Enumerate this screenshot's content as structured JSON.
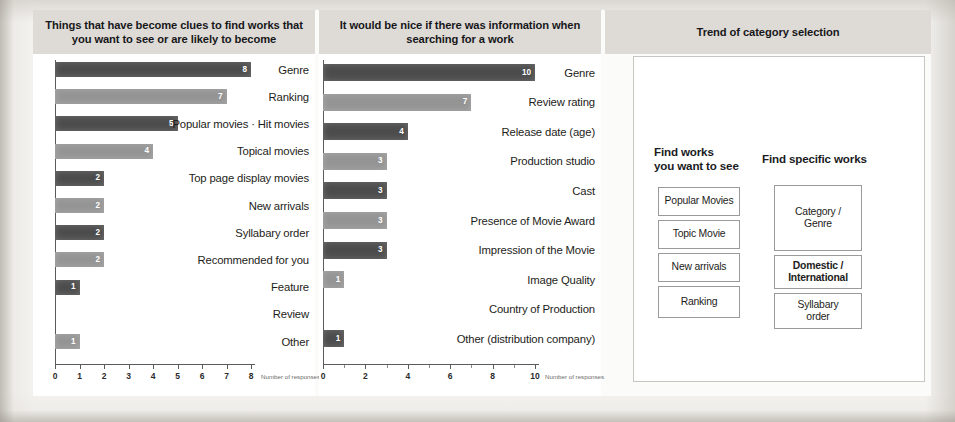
{
  "panels": {
    "left": {
      "title": "Things that have become clues to find works that you want to see or are likely to become",
      "axis_title": "Number of responses"
    },
    "middle": {
      "title": "It would be nice if there was information when searching for a work",
      "axis_title": "Number of responses"
    },
    "right": {
      "title": "Trend of category selection",
      "col1_title": "Find works\nyou want to see",
      "col1_title_line1": "Find works",
      "col1_title_line2": "you want to see",
      "col2_title": "Find specific works"
    }
  },
  "chart_data": [
    {
      "type": "bar",
      "orientation": "horizontal",
      "title": "Things that have become clues to find works that you want to see or are likely to become",
      "xlabel": "Number of responses",
      "ylabel": "",
      "xlim": [
        0,
        8
      ],
      "xticks": [
        0,
        1,
        2,
        3,
        4,
        5,
        6,
        7,
        8
      ],
      "grid": false,
      "categories": [
        "Genre",
        "Ranking",
        "Popular movies · Hit movies",
        "Topical movies",
        "Top page display movies",
        "New arrivals",
        "Syllabary order",
        "Recommended for you",
        "Feature",
        "Review",
        "Other"
      ],
      "values": [
        8,
        7,
        5,
        4,
        2,
        2,
        2,
        2,
        1,
        0,
        1
      ],
      "value_labels": [
        "8",
        "7",
        "5",
        "4",
        "2",
        "2",
        "2",
        "2",
        "1",
        "",
        "1"
      ],
      "bar_shades": [
        "dark",
        "light",
        "dark",
        "light",
        "dark",
        "light",
        "dark",
        "light",
        "dark",
        "none",
        "light"
      ]
    },
    {
      "type": "bar",
      "orientation": "horizontal",
      "title": "It would be nice if there was information when searching for a work",
      "xlabel": "Number of responses",
      "ylabel": "",
      "xlim": [
        0,
        10
      ],
      "xticks": [
        0,
        2,
        4,
        6,
        8,
        10
      ],
      "grid": false,
      "categories": [
        "Genre",
        "Review rating",
        "Release date (age)",
        "Production studio",
        "Cast",
        "Presence of Movie Award",
        "Impression of the Movie",
        "Image Quality",
        "Country of Production",
        "Other (distribution company)"
      ],
      "values": [
        10,
        7,
        4,
        3,
        3,
        3,
        3,
        1,
        0,
        1
      ],
      "value_labels": [
        "10",
        "7",
        "4",
        "3",
        "3",
        "3",
        "3",
        "1",
        "",
        "1"
      ],
      "bar_shades": [
        "dark",
        "light",
        "dark",
        "light",
        "dark",
        "light",
        "dark",
        "light",
        "none",
        "dark"
      ]
    }
  ],
  "trend": {
    "col1": [
      {
        "label": "Popular Movies",
        "bold": false
      },
      {
        "label": "Topic Movie",
        "bold": false
      },
      {
        "label": "New arrivals",
        "bold": false
      },
      {
        "label": "Ranking",
        "bold": false
      }
    ],
    "col2": [
      {
        "label": "Category /\nGenre",
        "line1": "Category /",
        "line2": "Genre",
        "bold": false
      },
      {
        "label": "Domestic /\nInternational",
        "line1": "Domestic /",
        "line2": "International",
        "bold": true
      },
      {
        "label": "Syllabary\norder",
        "line1": "Syllabary",
        "line2": "order",
        "bold": false
      }
    ]
  },
  "colors": {
    "bar_dark": "#4c4c4c",
    "bar_light": "#949494",
    "header_band": "#dedbd6",
    "panel_bg": "#ffffff",
    "page_bg": "#f3f2ef",
    "text": "#1d1d20"
  }
}
